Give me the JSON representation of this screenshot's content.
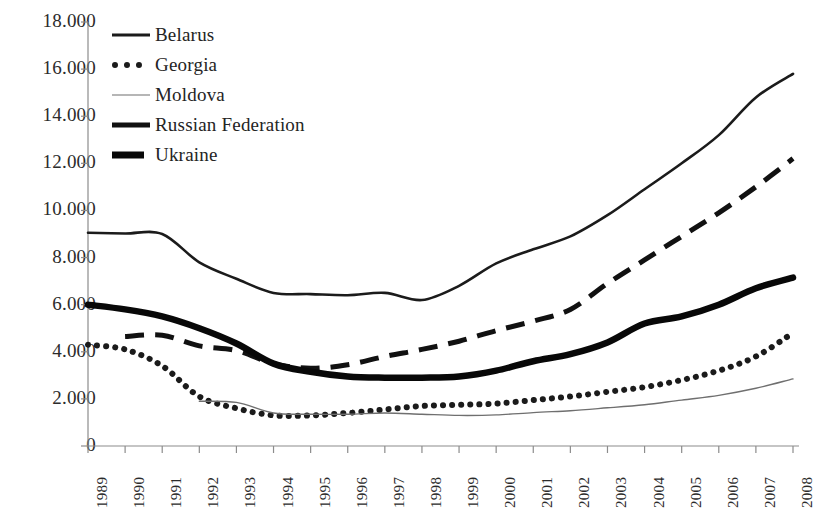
{
  "chart_data": {
    "type": "line",
    "title": "",
    "subtitle": "",
    "xlabel": "",
    "ylabel": "",
    "grid": false,
    "legend_position": "top-left",
    "x": [
      "1989",
      "1990",
      "1991",
      "1992",
      "1993",
      "1994",
      "1995",
      "1996",
      "1997",
      "1998",
      "1999",
      "2000",
      "2001",
      "2002",
      "2003",
      "2004",
      "2005",
      "2006",
      "2007",
      "2008"
    ],
    "xtick_labels": [
      "1989",
      "1990",
      "1991",
      "1992",
      "1993",
      "1994",
      "1995",
      "1996",
      "1997",
      "1998",
      "1999",
      "2000",
      "2001",
      "2002",
      "2003",
      "2004",
      "2005",
      "2006",
      "2007",
      "2008"
    ],
    "ytick_labels": [
      "0",
      "2.000",
      "4.000",
      "6.000",
      "8.000",
      "10.000",
      "12.000",
      "14.000",
      "16.000",
      "18.000"
    ],
    "ytick_values": [
      0,
      2000,
      4000,
      6000,
      8000,
      10000,
      12000,
      14000,
      16000,
      18000
    ],
    "ylim": [
      0,
      18000
    ],
    "series": [
      {
        "name": "Belarus",
        "style": "solid-thin",
        "color": "#1b1b1b",
        "values": [
          9050,
          9020,
          9000,
          7800,
          7100,
          6500,
          6450,
          6400,
          6500,
          6200,
          6800,
          7750,
          8350,
          8900,
          9800,
          10900,
          12000,
          13200,
          14800,
          15800
        ]
      },
      {
        "name": "Georgia",
        "style": "dotted",
        "color": "#1b1b1b",
        "values": [
          4300,
          4100,
          3400,
          2100,
          1600,
          1300,
          1300,
          1400,
          1550,
          1700,
          1750,
          1800,
          1950,
          2100,
          2300,
          2500,
          2800,
          3200,
          3800,
          4800
        ]
      },
      {
        "name": "Moldova",
        "style": "solid-hairline",
        "color": "#6f6f6f",
        "values": [
          null,
          null,
          null,
          1900,
          1850,
          1400,
          1350,
          1350,
          1400,
          1350,
          1300,
          1320,
          1420,
          1500,
          1620,
          1750,
          1950,
          2150,
          2450,
          2850
        ]
      },
      {
        "name": "Russian Federation",
        "style": "dashed",
        "color": "#111111",
        "values": [
          null,
          4650,
          4700,
          4250,
          4050,
          3500,
          3300,
          3450,
          3800,
          4100,
          4450,
          4900,
          5300,
          5800,
          6900,
          7900,
          8900,
          9900,
          11000,
          12200
        ]
      },
      {
        "name": "Ukraine",
        "style": "solid-thick",
        "color": "#080808",
        "values": [
          6000,
          5800,
          5500,
          5000,
          4350,
          3500,
          3150,
          2950,
          2900,
          2900,
          2950,
          3200,
          3600,
          3900,
          4400,
          5200,
          5500,
          6000,
          6700,
          7150
        ]
      }
    ],
    "legend": [
      {
        "label": "Belarus",
        "style": "solid-thin"
      },
      {
        "label": "Georgia",
        "style": "dotted"
      },
      {
        "label": "Moldova",
        "style": "solid-hairline"
      },
      {
        "label": "Russian Federation",
        "style": "dashed"
      },
      {
        "label": "Ukraine",
        "style": "solid-thick"
      }
    ],
    "axis_color": "#8c8c8c"
  }
}
